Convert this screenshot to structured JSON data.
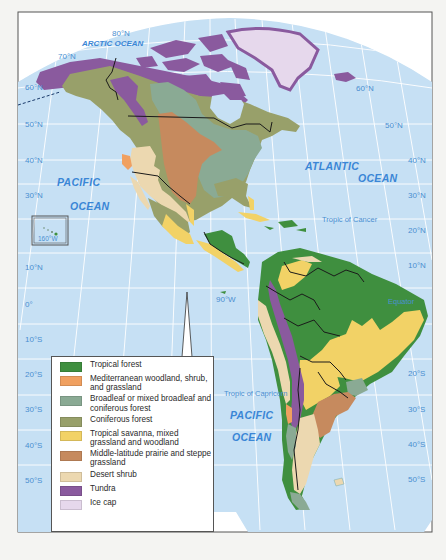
{
  "map": {
    "type": "biome map",
    "region": "The Americas",
    "ocean_labels": [
      {
        "id": "arctic",
        "text": "ARCTIC OCEAN"
      },
      {
        "id": "pacific-north-1",
        "text": "PACIFIC"
      },
      {
        "id": "pacific-north-2",
        "text": "OCEAN"
      },
      {
        "id": "atlantic-1",
        "text": "ATLANTIC"
      },
      {
        "id": "atlantic-2",
        "text": "OCEAN"
      },
      {
        "id": "pacific-south-1",
        "text": "PACIFIC"
      },
      {
        "id": "pacific-south-2",
        "text": "OCEAN"
      }
    ],
    "latitude_labels_left": [
      "80°N",
      "70°N",
      "60°N",
      "50°N",
      "40°N",
      "30°N",
      "10°N",
      "0°",
      "10°S",
      "20°S",
      "30°S",
      "40°S",
      "50°S"
    ],
    "latitude_labels_right": [
      "60°N",
      "50°N",
      "40°N",
      "30°N",
      "20°N",
      "10°N",
      "20°S",
      "30°S",
      "40°S",
      "50°S"
    ],
    "special_lines": [
      {
        "id": "tropic-cancer",
        "text": "Tropic of Cancer"
      },
      {
        "id": "equator",
        "text": "Equator"
      },
      {
        "id": "tropic-capricorn",
        "text": "Tropic of Capricorn"
      }
    ],
    "longitude_labels": [
      "90°W",
      "160°W"
    ],
    "inset": {
      "label": "160°W",
      "subject": "Hawaii"
    }
  },
  "legend": {
    "items": [
      {
        "label": "Tropical forest",
        "color": "#3f8f3f"
      },
      {
        "label": "Mediterranean woodland, shrub, and grassland",
        "color": "#f0a060"
      },
      {
        "label": "Broadleaf or mixed broadleaf and coniferous forest",
        "color": "#8aaa94"
      },
      {
        "label": "Coniferous forest",
        "color": "#98a06a"
      },
      {
        "label": "Tropical savanna, mixed grassland and woodland",
        "color": "#f2d266"
      },
      {
        "label": "Middle-latitude prairie and steppe grassland",
        "color": "#c68a5e"
      },
      {
        "label": "Desert shrub",
        "color": "#ecd8b0"
      },
      {
        "label": "Tundra",
        "color": "#8a5a9e"
      },
      {
        "label": "Ice cap",
        "color": "#e6d8ec"
      }
    ]
  },
  "colors": {
    "ocean": "#c6e0f4",
    "grid": "#ffffff",
    "border": "#1a1a1a",
    "label_blue": "#3a86d6"
  }
}
